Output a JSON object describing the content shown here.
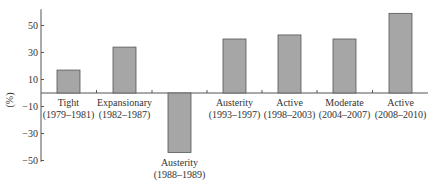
{
  "chart_data": {
    "type": "bar",
    "title": "",
    "xlabel": "",
    "ylabel": "(%)",
    "ylim": [
      -50,
      60
    ],
    "yticks": [
      50,
      30,
      10,
      -10,
      -30,
      -50
    ],
    "grid": false,
    "legend": null,
    "categories": [
      {
        "line1": "Tight",
        "line2": "(1979–1981)"
      },
      {
        "line1": "Expansionary",
        "line2": "(1982–1987)"
      },
      {
        "line1": "Austerity",
        "line2": "(1988–1989)"
      },
      {
        "line1": "Austerity",
        "line2": "(1993–1997)"
      },
      {
        "line1": "Active",
        "line2": "(1998–2003)"
      },
      {
        "line1": "Moderate",
        "line2": "(2004–2007)"
      },
      {
        "line1": "Active",
        "line2": "(2008–2010)"
      }
    ],
    "values": [
      17,
      34,
      -44,
      40,
      43,
      40,
      59
    ],
    "bar_color": "#a6a6a6",
    "bar_edge": "#555555"
  }
}
